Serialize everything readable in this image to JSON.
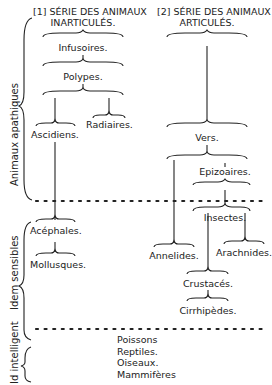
{
  "diagram": {
    "columns": [
      {
        "id": 1,
        "heading_line1": "[1] SÉRIE DES ANIMAUX",
        "heading_line2": "INARTICULÉS."
      },
      {
        "id": 2,
        "heading_line1": "[2] SÉRIE DES ANIMAUX",
        "heading_line2": "ARTICULÉS."
      }
    ],
    "groups": [
      {
        "label": "Animaux apathiques"
      },
      {
        "label": "Idem sensibles"
      },
      {
        "label": "Id intelligent"
      }
    ],
    "inarticulate": {
      "infusoires": "Infusoires.",
      "polypes": "Polypes.",
      "ascidiens": "Ascidiens.",
      "radiaires": "Radiaires.",
      "acephales": "Acéphales.",
      "mollusques": "Mollusques."
    },
    "articulate": {
      "vers": "Vers.",
      "epizoaires": "Epizoaires.",
      "insectes": "Insectes.",
      "annelides": "Annelides.",
      "arachnides": "Arachnides.",
      "crustaces": "Crustacés.",
      "cirrhipedes": "Cirrhipèdes."
    },
    "vertebrates": [
      "Poissons",
      "Reptiles.",
      "Oiseaux.",
      "Mammifères"
    ],
    "colors": {
      "ink": "#222222",
      "background": "#ffffff"
    }
  }
}
